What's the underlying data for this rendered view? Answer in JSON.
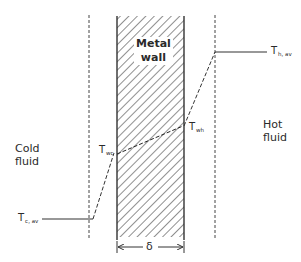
{
  "diagram": {
    "type": "temperature-profile",
    "wall": {
      "label_line1": "Metal",
      "label_line2": "wall",
      "thickness_symbol": "δ"
    },
    "regions": {
      "cold": {
        "line1": "Cold",
        "line2": "fluid"
      },
      "hot": {
        "line1": "Hot",
        "line2": "fluid"
      }
    },
    "temperatures": {
      "cold_avg": {
        "symbol": "T",
        "subscript": "c, av"
      },
      "wall_cold": {
        "symbol": "T",
        "subscript": "wc"
      },
      "wall_hot": {
        "symbol": "T",
        "subscript": "wh"
      },
      "hot_avg": {
        "symbol": "T",
        "subscript": "h, av"
      }
    },
    "colors": {
      "line": "#333333",
      "hatch": "#444444",
      "background": "#ffffff"
    }
  }
}
